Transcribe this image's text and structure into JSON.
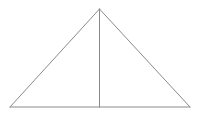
{
  "diagram": {
    "type": "geometry",
    "shape": "isosceles-triangle-with-altitude",
    "stroke_color": "#8a8a8a",
    "background_color": "#ffffff",
    "stroke_width": 1,
    "vertices": {
      "apex": {
        "x": 99.5,
        "y": 9
      },
      "base_left": {
        "x": 10,
        "y": 107
      },
      "base_right": {
        "x": 190,
        "y": 107
      },
      "altitude_foot": {
        "x": 99.5,
        "y": 107
      }
    },
    "segments": [
      {
        "name": "left-side",
        "from": "apex",
        "to": "base_left"
      },
      {
        "name": "right-side",
        "from": "apex",
        "to": "base_right"
      },
      {
        "name": "base",
        "from": "base_left",
        "to": "base_right"
      },
      {
        "name": "altitude",
        "from": "apex",
        "to": "altitude_foot"
      }
    ],
    "labels": []
  }
}
